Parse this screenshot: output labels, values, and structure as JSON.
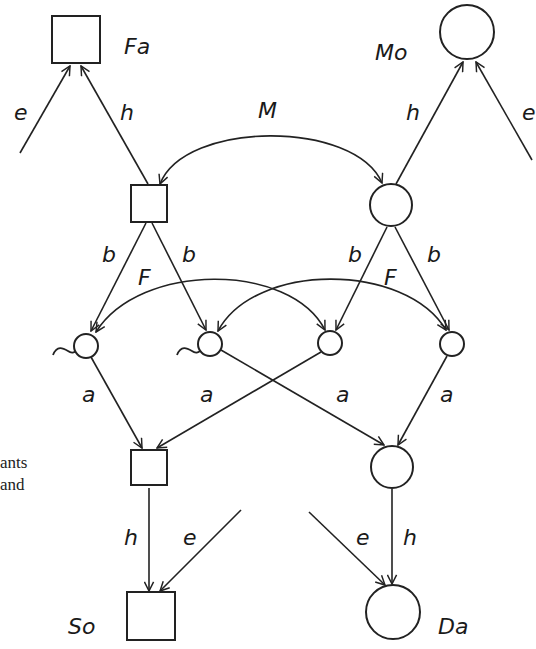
{
  "diagram": {
    "nodes": {
      "father": {
        "label": "Fa",
        "shape": "square"
      },
      "mother": {
        "label": "Mo",
        "shape": "circle"
      },
      "son": {
        "label": "So",
        "shape": "square"
      },
      "daughter": {
        "label": "Da",
        "shape": "circle"
      }
    },
    "path_labels": {
      "environment": "e",
      "heredity": "h",
      "mating": "M",
      "gamete": "b",
      "inbreeding": "F",
      "contribution": "a"
    },
    "edges": [
      {
        "from": "env",
        "to": "Fa",
        "label": "e"
      },
      {
        "from": "father-genotype",
        "to": "Fa",
        "label": "h"
      },
      {
        "from": "mother-genotype",
        "to": "Mo",
        "label": "h"
      },
      {
        "from": "env",
        "to": "Mo",
        "label": "e"
      },
      {
        "from": "father-genotype",
        "to": "mother-genotype",
        "label": "M",
        "bidirectional": true
      },
      {
        "from": "father-genotype",
        "to": "gamete-1",
        "label": "b"
      },
      {
        "from": "father-genotype",
        "to": "gamete-2",
        "label": "b"
      },
      {
        "from": "mother-genotype",
        "to": "gamete-3",
        "label": "b"
      },
      {
        "from": "mother-genotype",
        "to": "gamete-4",
        "label": "b"
      },
      {
        "from": "gamete-1",
        "to": "gamete-3",
        "label": "F",
        "bidirectional": true
      },
      {
        "from": "gamete-2",
        "to": "gamete-4",
        "label": "F",
        "bidirectional": true
      },
      {
        "from": "gamete-1",
        "to": "son-genotype",
        "label": "a"
      },
      {
        "from": "gamete-3",
        "to": "son-genotype",
        "label": "a"
      },
      {
        "from": "gamete-2",
        "to": "daughter-genotype",
        "label": "a"
      },
      {
        "from": "gamete-4",
        "to": "daughter-genotype",
        "label": "a"
      },
      {
        "from": "son-genotype",
        "to": "So",
        "label": "h"
      },
      {
        "from": "env",
        "to": "So",
        "label": "e"
      },
      {
        "from": "daughter-genotype",
        "to": "Da",
        "label": "h"
      },
      {
        "from": "env",
        "to": "Da",
        "label": "e"
      }
    ]
  },
  "side_text": [
    "ants",
    "and"
  ],
  "colors": {
    "ink": "#222222",
    "background": "#ffffff"
  }
}
